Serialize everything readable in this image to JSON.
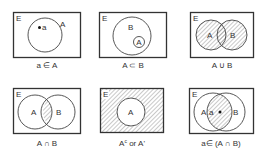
{
  "universal_label": "E",
  "panels": [
    {
      "id": "element-of",
      "caption": "a ∈ A",
      "labels": {
        "set_a": "A",
        "element": "a"
      }
    },
    {
      "id": "subset",
      "caption": "A ⊂ B",
      "labels": {
        "set_a": "A",
        "set_b": "B"
      }
    },
    {
      "id": "union",
      "caption": "A ∪ B",
      "labels": {
        "set_a": "A",
        "set_b": "B"
      },
      "shaded": "A or B"
    },
    {
      "id": "intersection",
      "caption": "A ∩ B",
      "labels": {
        "set_a": "A",
        "set_b": "B"
      },
      "shaded": "A and B"
    },
    {
      "id": "complement",
      "caption_main": "A",
      "caption_sup": "c",
      "caption_rest": " or A'",
      "labels": {
        "set_a": "A"
      },
      "shaded": "outside A"
    },
    {
      "id": "element-of-intersection",
      "caption": "a∈ (A  ∩  B)",
      "labels": {
        "set_a": "A",
        "set_b": "B",
        "element": "a"
      },
      "shaded": "A and B"
    }
  ],
  "colors": {
    "line": "#333333",
    "hatch": "#666666",
    "background": "#ffffff"
  }
}
